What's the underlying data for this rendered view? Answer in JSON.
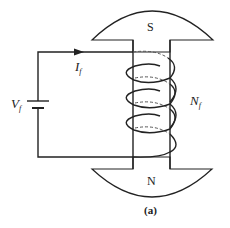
{
  "diagram": {
    "type": "dc-field-circuit",
    "caption": "(a)",
    "colors": {
      "line": "#222222",
      "background": "#ffffff"
    },
    "poles": {
      "top": {
        "label": "S"
      },
      "bottom": {
        "label": "N"
      }
    },
    "labels": {
      "current": {
        "main": "I",
        "sub": "f"
      },
      "voltage": {
        "main": "V",
        "sub": "f"
      },
      "turns": {
        "main": "N",
        "sub": "f"
      }
    },
    "coil": {
      "visible_loops": 3
    },
    "components": [
      "dc-voltage-source",
      "field-winding",
      "pole-pieces",
      "current-arrow"
    ]
  }
}
